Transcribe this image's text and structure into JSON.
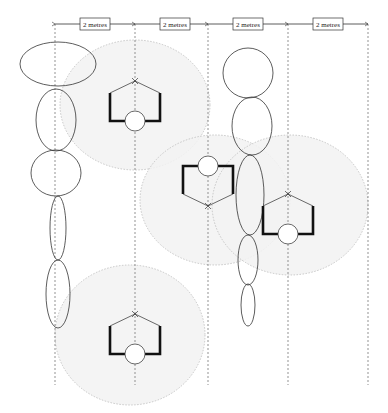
{
  "diagram": {
    "type": "spatial layout / proxemic zones",
    "dimension_labels": [
      "2 metres",
      "2 metres",
      "2 metres",
      "2 metres"
    ],
    "guides_x": [
      55,
      135,
      208,
      288,
      368
    ],
    "colors": {
      "stroke": "#333333",
      "zone_fill": "#f2f2f2",
      "zone_stroke": "#bbbbbb",
      "guide": "#666666"
    },
    "zones": [
      {
        "cx": 135,
        "cy": 105,
        "rx": 75,
        "ry": 65
      },
      {
        "cx": 215,
        "cy": 200,
        "rx": 75,
        "ry": 65
      },
      {
        "cx": 290,
        "cy": 205,
        "rx": 78,
        "ry": 70
      },
      {
        "cx": 130,
        "cy": 335,
        "rx": 75,
        "ry": 70
      }
    ],
    "workstations": [
      {
        "x": 135,
        "y": 105,
        "flip": false
      },
      {
        "x": 208,
        "y": 182,
        "flip": true
      },
      {
        "x": 288,
        "y": 218,
        "flip": false
      },
      {
        "x": 135,
        "y": 338,
        "flip": false
      }
    ],
    "chain_left": [
      {
        "cx": 58,
        "cy": 64,
        "rx": 38,
        "ry": 22
      },
      {
        "cx": 56,
        "cy": 120,
        "rx": 20,
        "ry": 31
      },
      {
        "cx": 56,
        "cy": 173,
        "rx": 25,
        "ry": 23
      },
      {
        "cx": 58,
        "cy": 228,
        "rx": 8,
        "ry": 32
      },
      {
        "cx": 58,
        "cy": 294,
        "rx": 12,
        "ry": 34
      }
    ],
    "chain_right": [
      {
        "cx": 248,
        "cy": 73,
        "rx": 25,
        "ry": 25
      },
      {
        "cx": 252,
        "cy": 126,
        "rx": 20,
        "ry": 29
      },
      {
        "cx": 250,
        "cy": 195,
        "rx": 14,
        "ry": 40
      },
      {
        "cx": 248,
        "cy": 260,
        "rx": 10,
        "ry": 25
      },
      {
        "cx": 248,
        "cy": 305,
        "rx": 7,
        "ry": 21
      }
    ]
  }
}
